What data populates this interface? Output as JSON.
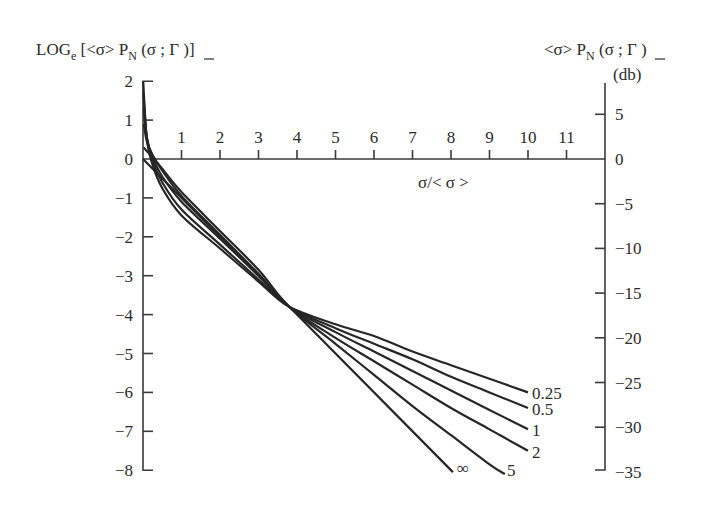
{
  "chart_data": {
    "type": "line",
    "title": "",
    "ylabel_left": "LOG_e [<σ> P_N (σ ; Γ)]",
    "ylabel_right": "<σ> P_N (σ ; Γ) (db)",
    "xlabel": "σ/< σ >",
    "xlim": [
      0,
      12
    ],
    "ylim": [
      -8,
      2
    ],
    "x_ticks": [
      1,
      2,
      3,
      4,
      5,
      6,
      7,
      8,
      9,
      10,
      11
    ],
    "y_ticks_left": [
      2,
      1,
      0,
      -1,
      -2,
      -3,
      -4,
      -5,
      -6,
      -7,
      -8
    ],
    "y_ticks_right_db": [
      5,
      0,
      -5,
      -10,
      -15,
      -20,
      -25,
      -30,
      -35
    ],
    "grid": false,
    "legend": "inline labels at curve ends",
    "series": [
      {
        "name": "0.25",
        "x": [
          0.005,
          0.1,
          0.25,
          0.5,
          1,
          2,
          3,
          3.8,
          5,
          6,
          7,
          8,
          9,
          10
        ],
        "values": [
          2.0,
          0.5,
          -0.15,
          -0.75,
          -1.45,
          -2.3,
          -3.15,
          -3.8,
          -4.25,
          -4.55,
          -4.95,
          -5.3,
          -5.65,
          -6.0
        ]
      },
      {
        "name": "0.5",
        "x": [
          0.01,
          0.1,
          0.25,
          0.5,
          1,
          2,
          3,
          3.8,
          5,
          6,
          7,
          8,
          9,
          10
        ],
        "values": [
          1.7,
          0.55,
          -0.05,
          -0.6,
          -1.3,
          -2.2,
          -3.1,
          -3.8,
          -4.35,
          -4.75,
          -5.15,
          -5.6,
          -6.0,
          -6.4
        ]
      },
      {
        "name": "1",
        "x": [
          0.02,
          0.1,
          0.25,
          0.5,
          1,
          2,
          3,
          3.8,
          5,
          6,
          7,
          8,
          9,
          10
        ],
        "values": [
          1.3,
          0.55,
          0.05,
          -0.45,
          -1.1,
          -2.05,
          -3.0,
          -3.8,
          -4.45,
          -4.95,
          -5.45,
          -5.95,
          -6.45,
          -6.95
        ]
      },
      {
        "name": "2",
        "x": [
          0.02,
          0.1,
          0.25,
          0.5,
          1,
          2,
          3,
          3.8,
          5,
          6,
          7,
          8,
          9,
          10
        ],
        "values": [
          0.9,
          0.45,
          0.1,
          -0.3,
          -0.95,
          -1.95,
          -2.95,
          -3.8,
          -4.6,
          -5.2,
          -5.8,
          -6.4,
          -6.95,
          -7.5
        ]
      },
      {
        "name": "5",
        "x": [
          0.02,
          0.1,
          0.25,
          0.5,
          1,
          2,
          3,
          3.8,
          5,
          6,
          7,
          8,
          9,
          9.4
        ],
        "values": [
          0.3,
          0.2,
          0.05,
          -0.25,
          -0.85,
          -1.85,
          -2.85,
          -3.8,
          -4.75,
          -5.55,
          -6.35,
          -7.1,
          -7.85,
          -8.1
        ]
      },
      {
        "name": "∞",
        "x": [
          0,
          8.05
        ],
        "values": [
          0,
          -8.05
        ]
      }
    ]
  },
  "labels": {
    "left_axis_title_main": "LOG",
    "left_axis_title_sub": "e",
    "left_axis_title_rest": " [<σ> P",
    "left_axis_title_sub2": "N",
    "left_axis_title_tail": " (σ ; Γ )]",
    "right_axis_title_main": "<σ> P",
    "right_axis_title_sub": "N",
    "right_axis_title_tail": " (σ ; Γ )",
    "right_axis_unit": "(db)",
    "x_axis_title": "σ/< σ >"
  }
}
